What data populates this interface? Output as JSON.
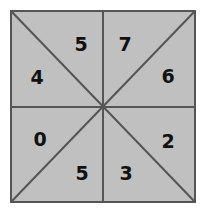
{
  "figure": {
    "name": "eight-sector-square",
    "background_color": "#ffffff",
    "fill_color": "#c0c0c0",
    "line_color": "#555555",
    "border_color": "#555555",
    "label_color": "#111111",
    "square": {
      "x": 11,
      "y": 11,
      "width": 184,
      "height": 191
    },
    "center": {
      "x": 103,
      "y": 107
    },
    "divider_lines": [
      {
        "name": "vertical-midline",
        "x1": 103,
        "y1": 11,
        "x2": 103,
        "y2": 202
      },
      {
        "name": "horizontal-midline",
        "x1": 11,
        "y1": 107,
        "x2": 195,
        "y2": 107
      },
      {
        "name": "diagonal-tl-br",
        "x1": 11,
        "y1": 11,
        "x2": 195,
        "y2": 202
      },
      {
        "name": "diagonal-tr-bl",
        "x1": 195,
        "y1": 11,
        "x2": 11,
        "y2": 202
      }
    ],
    "sectors": [
      {
        "name": "top-left-upper",
        "value": "5",
        "x": 81,
        "y": 44
      },
      {
        "name": "top-right-upper",
        "value": "7",
        "x": 125,
        "y": 44
      },
      {
        "name": "right-upper",
        "value": "6",
        "x": 168,
        "y": 76
      },
      {
        "name": "right-lower",
        "value": "2",
        "x": 168,
        "y": 141
      },
      {
        "name": "bottom-right-lower",
        "value": "3",
        "x": 126,
        "y": 173
      },
      {
        "name": "bottom-left-lower",
        "value": "5",
        "x": 82,
        "y": 173
      },
      {
        "name": "left-lower",
        "value": "0",
        "x": 40,
        "y": 139
      },
      {
        "name": "left-upper",
        "value": "4",
        "x": 37,
        "y": 77
      }
    ]
  }
}
